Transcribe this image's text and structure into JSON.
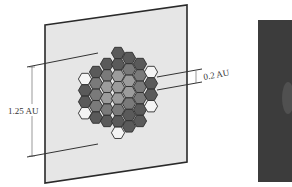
{
  "diagram": {
    "type": "hexagonal-segmented-mirror-on-plane",
    "labels": {
      "aperture": "1.25 AU",
      "segment": "0.2 AU"
    },
    "colors": {
      "plane_fill": "#e6e6e6",
      "plane_edge": "#2a2a2a",
      "hex_dark": "#5a5a5a",
      "hex_mid": "#7a7a7a",
      "hex_light": "#9c9c9c",
      "hex_empty": "#f4f4f4",
      "hex_edge": "#2e2e2e",
      "side_panel": "#3c3c3c"
    },
    "hex_columns": [
      {
        "x": 85,
        "cells": [
          "empty",
          "dark",
          "dark",
          "empty"
        ],
        "y0": 79
      },
      {
        "x": 96,
        "cells": [
          "dark",
          "mid",
          "mid",
          "mid",
          "dark"
        ],
        "y0": 72
      },
      {
        "x": 107,
        "cells": [
          "dark",
          "mid",
          "light",
          "light",
          "mid",
          "dark"
        ],
        "y0": 64
      },
      {
        "x": 118,
        "cells": [
          "dark",
          "dark",
          "light",
          "light",
          "light",
          "mid",
          "dark",
          "empty"
        ],
        "y0": 53
      },
      {
        "x": 129,
        "cells": [
          "dark",
          "mid",
          "light",
          "light",
          "mid",
          "dark",
          "dark"
        ],
        "y0": 58
      },
      {
        "x": 140,
        "cells": [
          "dark",
          "mid",
          "mid",
          "mid",
          "dark",
          "dark"
        ],
        "y0": 64
      },
      {
        "x": 151,
        "cells": [
          "empty",
          "dark",
          "dark",
          "empty"
        ],
        "y0": 72
      }
    ]
  }
}
